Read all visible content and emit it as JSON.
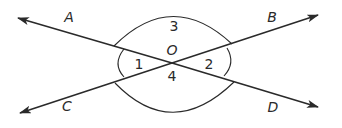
{
  "diagram": {
    "center": {
      "label": "O",
      "x": 172,
      "y": 63
    },
    "rays": [
      {
        "label": "A",
        "tip": [
          18,
          18
        ],
        "label_pos": [
          69,
          22
        ]
      },
      {
        "label": "B",
        "tip": [
          318,
          15
        ],
        "label_pos": [
          271,
          22
        ]
      },
      {
        "label": "C",
        "tip": [
          20,
          113
        ],
        "label_pos": [
          67,
          110
        ]
      },
      {
        "label": "D",
        "tip": [
          318,
          107
        ],
        "label_pos": [
          272,
          111
        ]
      }
    ],
    "angles": [
      {
        "label": "1",
        "pos": [
          137,
          68
        ]
      },
      {
        "label": "2",
        "pos": [
          207,
          68
        ]
      },
      {
        "label": "3",
        "pos": [
          172,
          28
        ]
      },
      {
        "label": "4",
        "pos": [
          172,
          79
        ]
      }
    ],
    "colors": {
      "line": "#2a2a2a",
      "background": "#ffffff"
    }
  }
}
